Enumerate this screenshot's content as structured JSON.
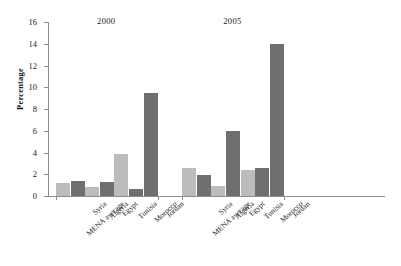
{
  "chart_data": {
    "type": "bar",
    "title": "",
    "xlabel": "",
    "ylabel": "Percentage",
    "ylim": [
      0,
      16
    ],
    "ytick_step": 2,
    "yticks": [
      16,
      14,
      12,
      10,
      8,
      6,
      4,
      2,
      0
    ],
    "grid": false,
    "legend": "none",
    "group_titles": [
      "2000",
      "2005"
    ],
    "categories": [
      "MENA average",
      "Syria",
      "Algeria",
      "Egypt",
      "Tunisia",
      "Morocco",
      "Jordan"
    ],
    "series": [
      {
        "name": "2000",
        "values": [
          1.2,
          1.4,
          0.8,
          1.3,
          3.9,
          0.6,
          9.5
        ]
      },
      {
        "name": "2005",
        "values": [
          2.6,
          1.9,
          0.9,
          6.0,
          2.4,
          2.6,
          14.0
        ]
      }
    ],
    "bar_colors": {
      "light": "#bcbcbc",
      "dark": "#6f6f6f"
    },
    "bar_color_pattern": [
      "light",
      "dark",
      "light",
      "dark",
      "light",
      "dark",
      "dark"
    ]
  }
}
